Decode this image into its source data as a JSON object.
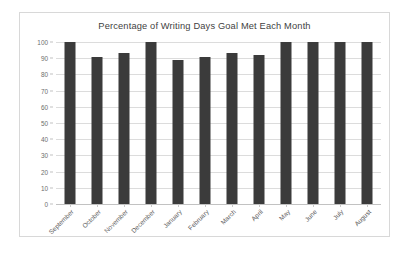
{
  "chart_data": {
    "type": "bar",
    "title": "Percentage of Writing Days Goal Met Each Month",
    "xlabel": "",
    "ylabel": "",
    "ylim": [
      0,
      100
    ],
    "yticks": [
      0,
      10,
      20,
      30,
      40,
      50,
      60,
      70,
      80,
      90,
      100
    ],
    "grid": true,
    "legend": false,
    "bar_color": "#3b3b3b",
    "categories": [
      "September",
      "October",
      "November",
      "December",
      "January",
      "February",
      "March",
      "April",
      "May",
      "June",
      "July",
      "August"
    ],
    "values": [
      100,
      91,
      93,
      100,
      89,
      91,
      93,
      92,
      100,
      100,
      100,
      100
    ]
  }
}
